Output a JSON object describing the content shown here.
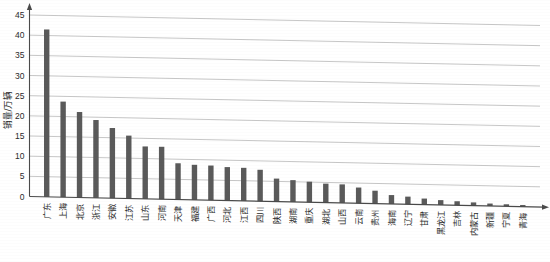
{
  "chart_data": {
    "type": "bar",
    "title": "",
    "xlabel": "",
    "ylabel": "销量/万辆",
    "ylim": [
      0,
      45
    ],
    "yticks": [
      0,
      5,
      10,
      15,
      20,
      25,
      30,
      35,
      40,
      45
    ],
    "grid": true,
    "legend": "none",
    "bar_color": "#5a5a5a",
    "categories": [
      "广东",
      "上海",
      "北京",
      "浙江",
      "安徽",
      "江苏",
      "山东",
      "河南",
      "天津",
      "福建",
      "广西",
      "河北",
      "江西",
      "四川",
      "陕西",
      "湖南",
      "重庆",
      "湖北",
      "山西",
      "云南",
      "贵州",
      "海南",
      "辽宁",
      "甘肃",
      "黑龙江",
      "吉林",
      "内蒙古",
      "新疆",
      "宁夏",
      "青海"
    ],
    "values": [
      41.5,
      23.7,
      21.2,
      19.3,
      17.4,
      15.6,
      13.0,
      13.0,
      9.0,
      8.7,
      8.6,
      8.3,
      8.2,
      7.8,
      5.7,
      5.4,
      5.1,
      4.7,
      4.6,
      3.9,
      3.2,
      2.2,
      1.9,
      1.5,
      1.2,
      1.0,
      0.8,
      0.6,
      0.5,
      0.4
    ]
  },
  "axes": {
    "y_axis_name": "y-axis",
    "x_axis_name": "x-axis"
  }
}
